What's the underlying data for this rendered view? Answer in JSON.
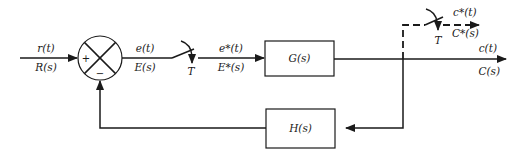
{
  "diagram": {
    "type": "sampled-data feedback control block diagram",
    "input": {
      "time_label": "r(t)",
      "s_label": "R(s)"
    },
    "summing_junction": {
      "plus_sign": "+",
      "minus_sign": "−"
    },
    "error": {
      "time_label": "e(t)",
      "s_label": "E(s)"
    },
    "sampler": {
      "period_label": "T"
    },
    "sampled_error": {
      "time_label": "e*(t)",
      "s_label": "E*(s)"
    },
    "forward_block": {
      "label": "G(s)"
    },
    "output": {
      "time_label": "c(t)",
      "s_label": "C(s)"
    },
    "output_sampler": {
      "period_label": "T"
    },
    "sampled_output": {
      "time_label": "c*(t)",
      "s_label": "C*(s)"
    },
    "feedback_block": {
      "label": "H(s)"
    }
  }
}
